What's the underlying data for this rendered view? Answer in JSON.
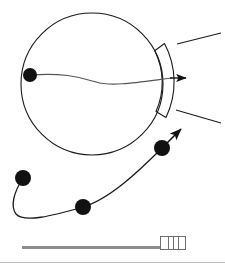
{
  "figure": {
    "title": "Ball trajectory diagram",
    "stroke_color": "#1a1a1a",
    "node_color": "#111111",
    "background": "#ffffff",
    "circle": {
      "label": "ball-outline",
      "cx": 92,
      "cy": 84,
      "r": 71
    },
    "arc_band": {
      "label": "curved-paddle",
      "inner_cx": 92,
      "inner_cy": 84,
      "inner_r": 71,
      "outer_r": 82,
      "top_angle_deg": -28,
      "bottom_angle_deg": 24
    },
    "whisker_lines": [
      {
        "label": "upper-whisker",
        "x1": 177,
        "y1": 44,
        "x2": 221,
        "y2": 33
      },
      {
        "label": "lower-whisker",
        "x1": 176,
        "y1": 110,
        "x2": 221,
        "y2": 123
      }
    ],
    "velocity_arrow": {
      "label": "horizontal-velocity-arrow",
      "from_x": 30,
      "from_y": 75,
      "to_x": 190,
      "to_y": 78,
      "direction": "right"
    },
    "trajectory_arrow": {
      "label": "diagonal-exit-arrow",
      "from_x": 162,
      "from_y": 148,
      "to_x": 184,
      "to_y": 126,
      "direction": "up-right"
    },
    "nodes": [
      {
        "label": "node-ball-center-left",
        "cx": 30,
        "cy": 75,
        "r": 7
      },
      {
        "label": "node-path-start",
        "cx": 23,
        "cy": 178,
        "r": 8
      },
      {
        "label": "node-path-middle",
        "cx": 83,
        "cy": 207,
        "r": 8
      },
      {
        "label": "node-path-end",
        "cx": 162,
        "cy": 148,
        "r": 8
      }
    ],
    "paths": [
      {
        "label": "wavy-chord",
        "d": "M 30 75 C 60 73 78 76 96 82 C 112 87 140 82 172 78"
      },
      {
        "label": "looping-trajectory",
        "d": "M 23 178 C 14 192 10 206 16 214 C 24 223 52 216 83 207 C 110 199 140 170 162 148"
      }
    ]
  },
  "scrollbar": {
    "label": "horizontal-scrollbar",
    "track_label": "scroll-track",
    "thumb_label": "scroll-thumb",
    "grip_count": 3,
    "value_percent": 72,
    "track_color": "#8d8d8d",
    "thumb_border_color": "#6f6f6f"
  },
  "footer": {
    "divider_label": "bottom-divider",
    "divider_color": "#bdbdbd"
  }
}
